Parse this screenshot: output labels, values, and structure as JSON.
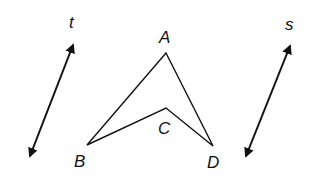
{
  "diagram": {
    "colors": {
      "stroke": "#111111",
      "background": "#ffffff"
    },
    "lines": [
      {
        "id": "t",
        "label": "t",
        "x1": 73,
        "y1": 45,
        "x2": 30,
        "y2": 156,
        "arrows": "both"
      },
      {
        "id": "s",
        "label": "s",
        "x1": 290,
        "y1": 46,
        "x2": 246,
        "y2": 156,
        "arrows": "both"
      }
    ],
    "points": [
      {
        "label": "A",
        "x": 166,
        "y": 53
      },
      {
        "label": "B",
        "x": 87,
        "y": 145
      },
      {
        "label": "C",
        "x": 166,
        "y": 108
      },
      {
        "label": "D",
        "x": 213,
        "y": 146
      }
    ],
    "segments": [
      "AB",
      "AD",
      "BC",
      "CD"
    ],
    "labels": {
      "t": "t",
      "s": "s",
      "A": "A",
      "B": "B",
      "C": "C",
      "D": "D"
    }
  }
}
